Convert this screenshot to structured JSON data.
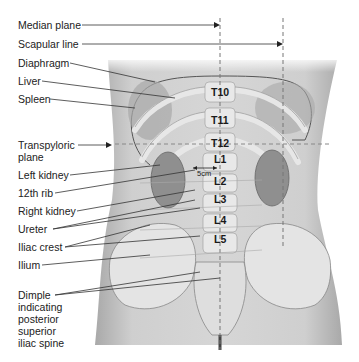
{
  "diagram": {
    "left_labels": [
      {
        "id": "median-plane",
        "text": "Median plane",
        "y": 25
      },
      {
        "id": "scapular-line",
        "text": "Scapular line",
        "y": 44
      },
      {
        "id": "diaphragm",
        "text": "Diaphragm",
        "y": 62
      },
      {
        "id": "liver",
        "text": "Liver",
        "y": 81
      },
      {
        "id": "spleen",
        "text": "Spleen",
        "y": 99
      },
      {
        "id": "transpyloric-plane",
        "text": "Transpyloric",
        "text2": "plane",
        "y": 145
      },
      {
        "id": "left-kidney",
        "text": "Left kidney",
        "y": 175
      },
      {
        "id": "12th-rib",
        "text": "12th rib",
        "y": 193
      },
      {
        "id": "right-kidney",
        "text": "Right kidney",
        "y": 211
      },
      {
        "id": "ureter",
        "text": "Ureter",
        "y": 229
      },
      {
        "id": "iliac-crest",
        "text": "Iliac crest",
        "y": 247
      },
      {
        "id": "ilium",
        "text": "Ilium",
        "y": 265
      },
      {
        "id": "dimple",
        "text": "Dimple",
        "y": 295
      }
    ],
    "dimple_lines": [
      "indicating",
      "posterior",
      "superior",
      "iliac spine"
    ],
    "vertebrae": [
      {
        "label": "T10",
        "x": 220,
        "y": 92
      },
      {
        "label": "T11",
        "x": 220,
        "y": 120
      },
      {
        "label": "T12",
        "x": 218,
        "y": 143
      },
      {
        "label": "L1",
        "x": 218,
        "y": 159
      },
      {
        "label": "L2",
        "x": 218,
        "y": 181
      },
      {
        "label": "L3",
        "x": 218,
        "y": 199
      },
      {
        "label": "L4",
        "x": 218,
        "y": 220
      },
      {
        "label": "L5",
        "x": 218,
        "y": 239
      }
    ],
    "measure": "5cm",
    "colors": {
      "skin": "#c9c9c9",
      "bone": "#e6e6e6",
      "organ": "#9a9a9a",
      "line": "#333333",
      "dash": "#777777"
    }
  }
}
